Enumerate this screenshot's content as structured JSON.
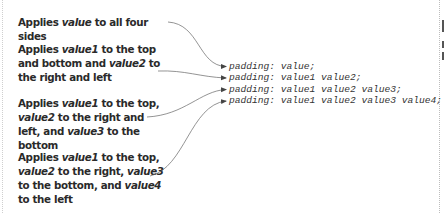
{
  "descriptions": [
    {
      "parts": [
        "Applies ",
        "value",
        " to all four sides"
      ]
    },
    {
      "parts": [
        "Applies ",
        "value1",
        " to the top and bottom and ",
        "value2",
        " to the right and left"
      ]
    },
    {
      "parts": [
        "Applies ",
        "value1",
        " to the top, ",
        "value2",
        " to the right and left, and ",
        "value3",
        " to the bottom"
      ]
    },
    {
      "parts": [
        "Applies ",
        "value1",
        " to the top, ",
        "value2",
        " to the right, ",
        "value3",
        " to the bottom, and ",
        "value4",
        " to the left"
      ]
    }
  ],
  "code_lines": [
    "padding: value;",
    "padding: value1 value2;",
    "padding: value1 value2 value3;",
    "padding: value1 value2 value3 value4;"
  ],
  "colors": {
    "text": "#2a2a2a",
    "code": "#333333",
    "arrow": "#555555",
    "frame": "#cfcfcf"
  }
}
